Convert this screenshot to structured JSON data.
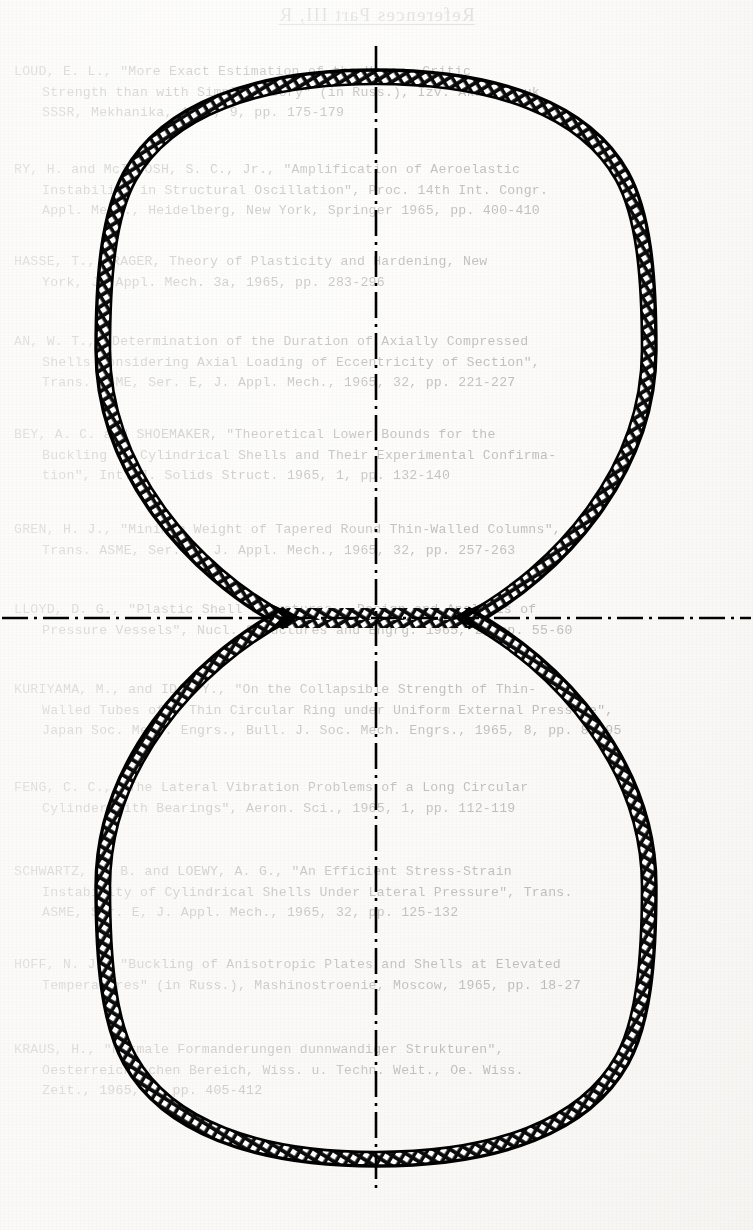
{
  "page": {
    "header": "References  Part III, R",
    "background_color": "#fcfbf9",
    "ink_color": "#000000"
  },
  "references": [
    {
      "id": "ref-1",
      "top": 62,
      "lines": [
        "LOUD, E. L., \"More Exact Estimation of the Upper  Critic",
        "Strength than with Simple Theory\" (in Russ.), Izv. Akad. Nauk",
        "SSSR, Mekhanika, 1965, 9, pp. 175-179"
      ]
    },
    {
      "id": "ref-2",
      "top": 160,
      "lines": [
        "RY, H. and McINTOSH, S. C., Jr., \"Amplification of Aeroelastic",
        "Instability in Structural Oscillation\", Proc. 14th Int. Congr.",
        "Appl. Mech., Heidelberg, New York, Springer 1965, pp. 400-410"
      ]
    },
    {
      "id": "ref-3",
      "top": 252,
      "lines": [
        "HASSE, T., PRAGER, Theory of Plasticity and Hardening, New",
        "York, J. Appl. Mech. 3a, 1965, pp. 283-296"
      ]
    },
    {
      "id": "ref-4",
      "top": 332,
      "lines": [
        "AN, W. T., \"Determination of the Duration of Axially Compressed",
        "Shells Considering Axial Loading of Eccentricity of Section\",",
        "Trans. ASME, Ser. E, J. Appl. Mech., 1965, 32, pp. 221-227"
      ]
    },
    {
      "id": "ref-5",
      "top": 425,
      "lines": [
        "BEY, A. C. and SHOEMAKER, \"Theoretical Lower Bounds for the",
        "Buckling of Cylindrical Shells and Their Experimental Confirma-",
        "tion\", Int. J. Solids Struct. 1965, 1, pp. 132-140"
      ]
    },
    {
      "id": "ref-6",
      "top": 520,
      "lines": [
        "GREN, H. J., \"Minimum Weight of Tapered Round Thin-Walled Columns\",",
        "Trans. ASME, Ser. E, J. Appl. Mech., 1965, 32, pp. 257-263"
      ]
    },
    {
      "id": "ref-7",
      "top": 600,
      "lines": [
        "LLOYD, D. G., \"Plastic Shell Structures — Design and Analysis of",
        "Pressure Vessels\", Nucl. Structures and Engrg. 1965, 2, pp. 55-60"
      ]
    },
    {
      "id": "ref-8",
      "top": 680,
      "lines": [
        "KURIYAMA, M., and IDA, Y., \"On the Collapsible Strength of Thin-",
        "Walled Tubes of a Thin Circular Ring under Uniform External Pressure\",",
        "Japan Soc. Mech. Engrs., Bull. J. Soc. Mech. Engrs., 1965, 8, pp. 88-95"
      ]
    },
    {
      "id": "ref-9",
      "top": 778,
      "lines": [
        "FENG, C. C., \"The Lateral Vibration Problems of a Long Circular",
        "Cylinder with Bearings\", Aeron. Sci., 1965, 1, pp. 112-119"
      ]
    },
    {
      "id": "ref-10",
      "top": 862,
      "lines": [
        "SCHWARTZ, E. B. and LOEWY, A. G., \"An Efficient Stress-Strain",
        "Instability of Cylindrical Shells Under Lateral Pressure\", Trans.",
        "ASME, Ser. E, J. Appl. Mech., 1965, 32, pp. 125-132"
      ]
    },
    {
      "id": "ref-11",
      "top": 955,
      "lines": [
        "HOFF, N. J., \"Buckling of Anisotropic Plates and Shells at Elevated",
        "Temperatures\" (in Russ.), Mashinostroenie, Moscow, 1965, pp. 18-27"
      ]
    },
    {
      "id": "ref-12",
      "top": 1040,
      "lines": [
        "KRAUS, H., \"Normale Formanderungen dunnwandiger Strukturen\",",
        "Oesterreichischen Bereich, Wiss. u. Techn. Weit., Oe. Wiss.",
        "Zeit., 1965, 9, pp. 405-412"
      ]
    }
  ],
  "drawing": {
    "name": "figure-eight-shell-cross-section",
    "description": "Symmetric two-lobe (figure-eight) pressure vessel cross-section with hatched section walls and dash-dot centerlines",
    "centerlines": {
      "vertical_x": 376,
      "horizontal_y": 618,
      "style": "dash-dot"
    },
    "geometry": {
      "upper_lobe_center_y": 350,
      "lower_lobe_center_y": 886,
      "lobe_radius": 268,
      "cusp_left_x": 290,
      "cusp_right_x": 462,
      "wall_thickness": 14
    },
    "hatch": {
      "angle_deg": 60,
      "spacing": 9,
      "color": "#0d0d0d"
    }
  }
}
